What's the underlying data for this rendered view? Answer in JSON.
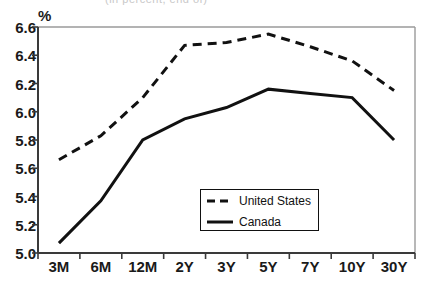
{
  "chart_data": {
    "type": "line",
    "title": "",
    "clipped_title_remnant": "(in percent, end of)",
    "xlabel": "",
    "ylabel": "%",
    "categories": [
      "3M",
      "6M",
      "12M",
      "2Y",
      "3Y",
      "5Y",
      "7Y",
      "10Y",
      "30Y"
    ],
    "ylim": [
      5.0,
      6.6
    ],
    "yticks": [
      "5.0",
      "5.2",
      "5.4",
      "5.6",
      "5.8",
      "6.0",
      "6.2",
      "6.4",
      "6.6"
    ],
    "ytick_values": [
      5.0,
      5.2,
      5.4,
      5.6,
      5.8,
      6.0,
      6.2,
      6.4,
      6.6
    ],
    "grid": false,
    "legend_position": "lower-center",
    "series": [
      {
        "name": "United States",
        "style": "dashed",
        "color": "#111111",
        "values": [
          5.66,
          5.83,
          6.1,
          6.47,
          6.49,
          6.55,
          6.46,
          6.36,
          6.15
        ]
      },
      {
        "name": "Canada",
        "style": "solid",
        "color": "#111111",
        "values": [
          5.07,
          5.37,
          5.8,
          5.95,
          6.03,
          6.16,
          6.13,
          6.1,
          5.8
        ]
      }
    ]
  },
  "legend": {
    "entries": [
      {
        "label": "United States",
        "sample": "dashed-line-sample"
      },
      {
        "label": "Canada",
        "sample": "solid-line-sample"
      }
    ]
  }
}
